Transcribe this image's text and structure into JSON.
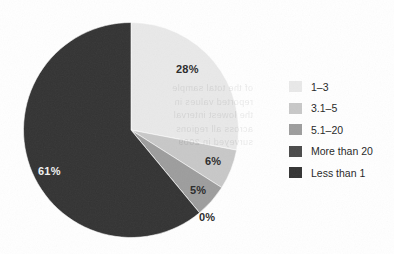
{
  "chart_data": {
    "type": "pie",
    "title": "",
    "categories": [
      "1–3",
      "3.1–5",
      "5.1–20",
      "More than 20",
      "Less than 1"
    ],
    "values": [
      28,
      6,
      5,
      0,
      61
    ],
    "labels": [
      "28%",
      "6%",
      "5%",
      "0%",
      "61%"
    ],
    "colors": [
      "#e9e9e9",
      "#c8c8c8",
      "#9d9d9d",
      "#4a4a4a",
      "#333333"
    ],
    "start_angle_deg": 0,
    "direction": "clockwise",
    "legend_position": "right",
    "grid": false,
    "xlabel": "",
    "ylabel": ""
  },
  "pie": {
    "slices": [
      {
        "name": "1–3",
        "label": "28%",
        "value": 28,
        "color": "#e9e9e9",
        "label_on_dark": false
      },
      {
        "name": "3.1–5",
        "label": "6%",
        "value": 6,
        "color": "#c8c8c8",
        "label_on_dark": false
      },
      {
        "name": "5.1–20",
        "label": "5%",
        "value": 5,
        "color": "#9d9d9d",
        "label_on_dark": false
      },
      {
        "name": "More than 20",
        "label": "0%",
        "value": 0,
        "color": "#4a4a4a",
        "label_on_dark": false
      },
      {
        "name": "Less than 1",
        "label": "61%",
        "value": 61,
        "color": "#333333",
        "label_on_dark": true
      }
    ]
  },
  "legend": {
    "items": [
      {
        "label": "1–3",
        "color": "#e9e9e9"
      },
      {
        "label": "3.1–5",
        "color": "#c8c8c8"
      },
      {
        "label": "5.1–20",
        "color": "#9d9d9d"
      },
      {
        "label": "More than 20",
        "color": "#4a4a4a"
      },
      {
        "label": "Less than 1",
        "color": "#333333"
      }
    ]
  },
  "artifacts": {
    "bleed_through_lines": [
      "of the total sample",
      "reported values in",
      "the lowest interval",
      "across all regions",
      "surveyed in 2009"
    ]
  }
}
